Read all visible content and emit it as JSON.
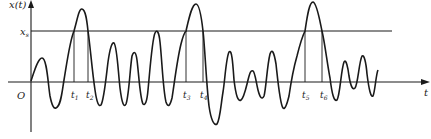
{
  "figure": {
    "y_axis_label": "x(t)",
    "x_axis_label": "t",
    "origin_label": "O",
    "threshold_label": "x",
    "threshold_subscript": "s",
    "crossing_labels": [
      {
        "name": "t",
        "sub": "1"
      },
      {
        "name": "t",
        "sub": "2"
      },
      {
        "name": "t",
        "sub": "3"
      },
      {
        "name": "t",
        "sub": "4"
      },
      {
        "name": "t",
        "sub": "5"
      },
      {
        "name": "t",
        "sub": "6"
      }
    ],
    "colors": {
      "line": "#1a1a1a",
      "background": "#ffffff"
    }
  }
}
